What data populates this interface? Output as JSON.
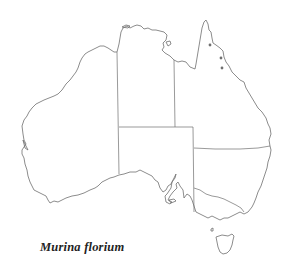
{
  "map": {
    "region": "Australia",
    "species_label": "Murina florium",
    "occurrence_points": [
      {
        "x": 210,
        "y": 45
      },
      {
        "x": 221,
        "y": 58
      },
      {
        "x": 222,
        "y": 68
      }
    ],
    "colors": {
      "outline": "#6f6f6f",
      "points": "#707070",
      "label": "#222222",
      "background": "#ffffff"
    }
  }
}
